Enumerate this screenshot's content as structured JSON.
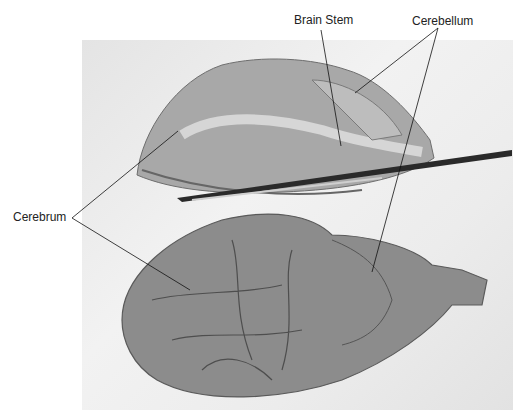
{
  "figure": {
    "labels": {
      "brain_stem": "Brain Stem",
      "cerebellum": "Cerebellum",
      "cerebrum": "Cerebrum"
    }
  }
}
